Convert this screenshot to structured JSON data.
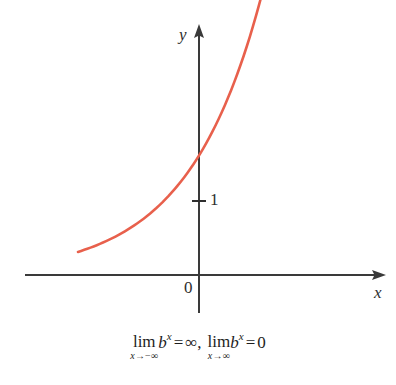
{
  "figure": {
    "background_color": "#ffffff",
    "curve_color": "#e8604c",
    "axis_color": "#3a3a3a",
    "text_color": "#1d1d1d"
  },
  "axes": {
    "x_label": "x",
    "y_label": "y",
    "origin_label": "0",
    "y_tick_label": "1"
  },
  "caption": {
    "limit1": {
      "lim_word": "lim",
      "sub_var": "x",
      "sub_arrow": "→",
      "sub_target": "−∞",
      "base": "b",
      "exponent": "x",
      "equals": "=",
      "value": "∞"
    },
    "separator": ",",
    "limit2": {
      "lim_word": "lim",
      "sub_var": "x",
      "sub_arrow": "→",
      "sub_target": "∞",
      "base": "b",
      "exponent": "x",
      "equals": "=",
      "value": "0"
    },
    "plain_text": "lim (x→−∞) b^x = ∞,  lim (x→∞) b^x = 0"
  },
  "chart_data": {
    "type": "line",
    "title": "",
    "subtitle": "",
    "xlabel": "x",
    "ylabel": "y",
    "function": "y = b^x, 0 < b < 1",
    "grid": false,
    "legend": null,
    "xlim": [
      -2.4,
      6.0
    ],
    "ylim": [
      -0.6,
      5.4
    ],
    "axis_arrows": [
      "x-positive",
      "y-positive"
    ],
    "tick_labels": {
      "x": [
        "0"
      ],
      "y": [
        "1"
      ]
    },
    "marked_points": [
      {
        "x": 0,
        "y": 1,
        "label": "1",
        "note": "y-intercept tick on y-axis"
      }
    ],
    "series": [
      {
        "name": "y = b^x",
        "color": "#e8604c",
        "x": [
          -2.4,
          -2.1,
          -1.8,
          -1.5,
          -1.2,
          -0.9,
          -0.6,
          -0.3,
          0.0,
          0.5,
          1.0,
          1.5,
          2.0,
          2.5,
          3.0,
          3.5,
          4.0,
          4.5,
          5.0,
          5.5,
          6.0
        ],
        "y": [
          5.06,
          4.27,
          3.6,
          3.04,
          2.57,
          2.17,
          1.83,
          1.54,
          1.0,
          1.0,
          0.77,
          0.6,
          0.46,
          0.36,
          0.28,
          0.21,
          0.16,
          0.13,
          0.1,
          0.08,
          0.06
        ]
      }
    ]
  }
}
